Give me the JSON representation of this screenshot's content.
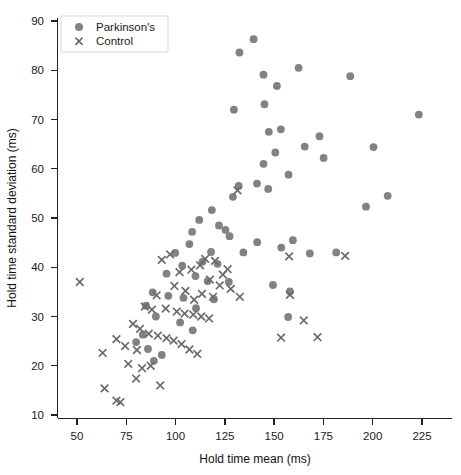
{
  "chart_data": {
    "type": "scatter",
    "title": "",
    "xlabel": "Hold time mean (ms)",
    "ylabel": "Hold time standard deviation (ms)",
    "xlim": [
      42,
      235
    ],
    "ylim": [
      8,
      92
    ],
    "xticks": [
      50,
      75,
      100,
      125,
      150,
      175,
      200,
      225
    ],
    "yticks": [
      10,
      20,
      30,
      40,
      50,
      60,
      70,
      80,
      90
    ],
    "grid": false,
    "legend_position": "top-left",
    "marker_color": "#828282",
    "cross_color": "#6b6b6b",
    "series": [
      {
        "name": "Parkinson's",
        "marker": "circle",
        "points": [
          [
            139.6,
            86.3
          ],
          [
            132.4,
            83.6
          ],
          [
            162.4,
            80.5
          ],
          [
            188.6,
            78.8
          ],
          [
            144.6,
            79.1
          ],
          [
            151.4,
            76.8
          ],
          [
            223.4,
            71.0
          ],
          [
            145.1,
            73.1
          ],
          [
            129.6,
            72.0
          ],
          [
            153.4,
            68.0
          ],
          [
            147.3,
            67.5
          ],
          [
            173.0,
            66.6
          ],
          [
            165.5,
            64.5
          ],
          [
            150.6,
            63.3
          ],
          [
            175.1,
            62.2
          ],
          [
            200.4,
            64.4
          ],
          [
            144.6,
            61.0
          ],
          [
            157.3,
            58.8
          ],
          [
            141.3,
            57.0
          ],
          [
            132.0,
            56.5
          ],
          [
            147.0,
            55.9
          ],
          [
            129.1,
            54.3
          ],
          [
            196.6,
            52.3
          ],
          [
            207.6,
            54.5
          ],
          [
            118.4,
            51.6
          ],
          [
            112.0,
            49.6
          ],
          [
            122.0,
            48.5
          ],
          [
            108.4,
            47.2
          ],
          [
            125.3,
            47.6
          ],
          [
            127.4,
            46.3
          ],
          [
            141.4,
            45.1
          ],
          [
            159.5,
            45.5
          ],
          [
            153.6,
            44.0
          ],
          [
            107.0,
            44.7
          ],
          [
            99.8,
            42.9
          ],
          [
            118.0,
            43.1
          ],
          [
            134.4,
            43.0
          ],
          [
            168.1,
            42.8
          ],
          [
            181.5,
            43.0
          ],
          [
            113.6,
            41.1
          ],
          [
            121.3,
            40.7
          ],
          [
            103.4,
            40.3
          ],
          [
            95.4,
            38.7
          ],
          [
            110.1,
            38.2
          ],
          [
            116.3,
            37.2
          ],
          [
            127.0,
            37.0
          ],
          [
            149.4,
            36.4
          ],
          [
            158.0,
            35.1
          ],
          [
            88.4,
            34.9
          ],
          [
            96.3,
            34.2
          ],
          [
            104.0,
            33.8
          ],
          [
            85.0,
            32.2
          ],
          [
            119.4,
            33.5
          ],
          [
            110.4,
            31.7
          ],
          [
            90.0,
            30.0
          ],
          [
            157.1,
            29.9
          ],
          [
            102.3,
            28.8
          ],
          [
            108.7,
            27.2
          ],
          [
            83.4,
            26.3
          ],
          [
            80.0,
            24.8
          ],
          [
            86.0,
            23.4
          ],
          [
            93.0,
            22.2
          ],
          [
            89.0,
            21.0
          ]
        ]
      },
      {
        "name": "Control",
        "marker": "cross",
        "points": [
          [
            51.4,
            37.0
          ],
          [
            131.4,
            55.6
          ],
          [
            97.2,
            42.6
          ],
          [
            93.0,
            41.5
          ],
          [
            115.0,
            41.7
          ],
          [
            120.0,
            41.3
          ],
          [
            112.4,
            40.4
          ],
          [
            108.0,
            39.5
          ],
          [
            102.0,
            39.0
          ],
          [
            126.4,
            39.6
          ],
          [
            124.0,
            38.5
          ],
          [
            117.4,
            37.5
          ],
          [
            122.4,
            36.3
          ],
          [
            128.0,
            35.6
          ],
          [
            99.4,
            36.2
          ],
          [
            105.0,
            35.2
          ],
          [
            90.4,
            34.3
          ],
          [
            113.4,
            34.6
          ],
          [
            119.0,
            34.0
          ],
          [
            109.4,
            33.4
          ],
          [
            132.6,
            34.0
          ],
          [
            157.6,
            42.2
          ],
          [
            186.0,
            42.3
          ],
          [
            158.0,
            34.4
          ],
          [
            84.4,
            32.0
          ],
          [
            88.0,
            31.4
          ],
          [
            95.0,
            31.6
          ],
          [
            100.6,
            31.0
          ],
          [
            104.6,
            30.6
          ],
          [
            109.0,
            30.4
          ],
          [
            113.0,
            30.0
          ],
          [
            117.0,
            29.6
          ],
          [
            78.4,
            28.5
          ],
          [
            82.0,
            27.5
          ],
          [
            86.4,
            26.5
          ],
          [
            91.0,
            26.1
          ],
          [
            95.4,
            25.6
          ],
          [
            99.0,
            25.1
          ],
          [
            103.0,
            24.4
          ],
          [
            70.0,
            25.4
          ],
          [
            74.4,
            24.0
          ],
          [
            80.4,
            23.2
          ],
          [
            107.0,
            23.3
          ],
          [
            165.0,
            29.2
          ],
          [
            153.5,
            25.7
          ],
          [
            172.0,
            25.8
          ],
          [
            64.0,
            15.4
          ],
          [
            70.0,
            12.9
          ],
          [
            72.0,
            12.6
          ],
          [
            92.2,
            16.0
          ],
          [
            80.0,
            17.4
          ],
          [
            83.0,
            19.5
          ],
          [
            87.4,
            20.0
          ],
          [
            76.0,
            20.4
          ],
          [
            111.0,
            22.4
          ],
          [
            63.0,
            22.6
          ]
        ]
      }
    ]
  },
  "legend": {
    "items": [
      {
        "label": "Parkinson's",
        "marker": "circle"
      },
      {
        "label": "Control",
        "marker": "cross"
      }
    ]
  }
}
